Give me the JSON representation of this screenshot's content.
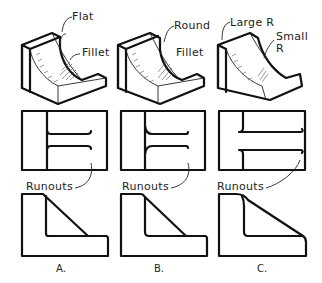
{
  "figure": {
    "columns": [
      {
        "caption": "A.",
        "callouts": [
          "Flat",
          "Fillet"
        ],
        "runout_label": "Runouts",
        "description": "Flat intersection with fillet; runouts end abruptly"
      },
      {
        "caption": "B.",
        "callouts": [
          "Round",
          "Fillet"
        ],
        "runout_label": "Runouts",
        "description": "Rounded intersection with fillet; runouts curve outward"
      },
      {
        "caption": "C.",
        "callouts": [
          "Large R",
          "Small",
          "R"
        ],
        "runout_label": "Runouts",
        "description": "Large and small radius; runouts curl"
      }
    ],
    "rows": [
      "isometric-views",
      "top-views",
      "front-views"
    ]
  },
  "colors": {
    "line": "#111111",
    "background": "#ffffff"
  }
}
